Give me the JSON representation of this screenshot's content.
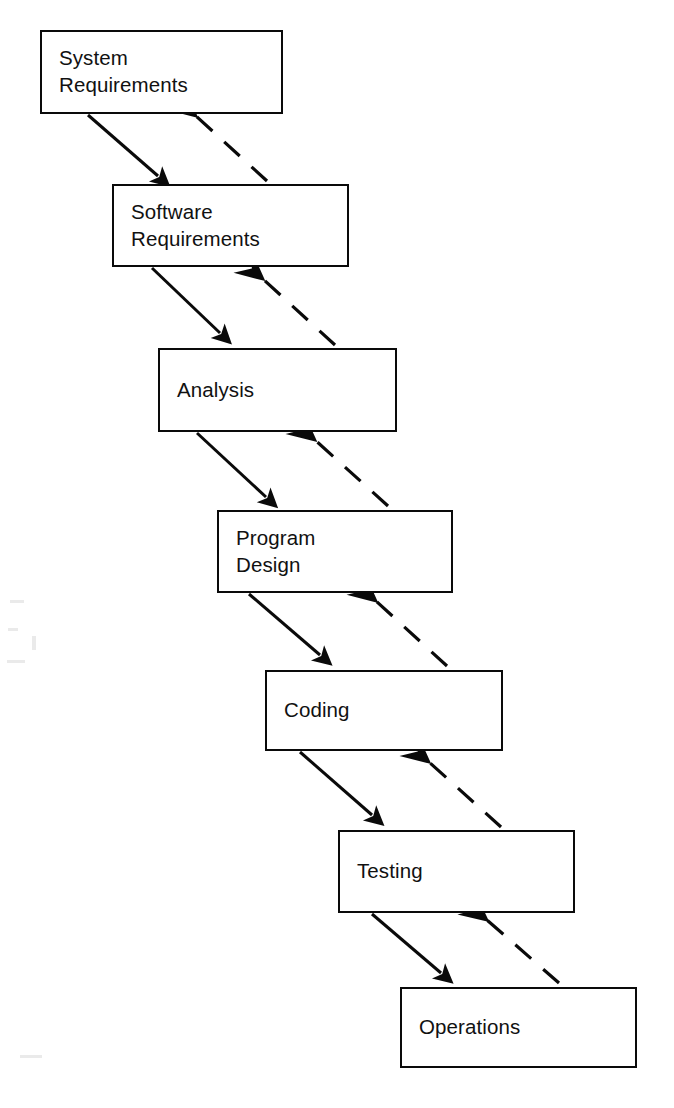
{
  "diagram": {
    "background_color": "#ffffff",
    "line_color": "#0a0a0a",
    "text_color": "#111111",
    "width": 674,
    "height": 1108,
    "stages": [
      {
        "id": "system-requirements",
        "label": "System\nRequirements",
        "x": 40,
        "y": 30,
        "w": 243,
        "h": 84
      },
      {
        "id": "software-requirements",
        "label": "Software\nRequirements",
        "x": 112,
        "y": 184,
        "w": 237,
        "h": 83
      },
      {
        "id": "analysis",
        "label": "Analysis",
        "x": 158,
        "y": 348,
        "w": 239,
        "h": 84
      },
      {
        "id": "program-design",
        "label": "Program\nDesign",
        "x": 217,
        "y": 510,
        "w": 236,
        "h": 83
      },
      {
        "id": "coding",
        "label": "Coding",
        "x": 265,
        "y": 670,
        "w": 238,
        "h": 81
      },
      {
        "id": "testing",
        "label": "Testing",
        "x": 338,
        "y": 830,
        "w": 237,
        "h": 83
      },
      {
        "id": "operations",
        "label": "Operations",
        "x": 400,
        "y": 987,
        "w": 237,
        "h": 81
      }
    ],
    "forward_arrows": [
      {
        "id": "arrow-system-to-software",
        "from": "system-requirements",
        "to": "software-requirements",
        "x1": 88,
        "y1": 115,
        "x2": 158,
        "y2": 176,
        "style": "solid"
      },
      {
        "id": "arrow-software-to-analysis",
        "from": "software-requirements",
        "to": "analysis",
        "x1": 152,
        "y1": 268,
        "x2": 220,
        "y2": 333,
        "style": "solid"
      },
      {
        "id": "arrow-analysis-to-program-design",
        "from": "analysis",
        "to": "program-design",
        "x1": 197,
        "y1": 433,
        "x2": 266,
        "y2": 497,
        "style": "solid"
      },
      {
        "id": "arrow-program-design-to-coding",
        "from": "program-design",
        "to": "coding",
        "x1": 249,
        "y1": 594,
        "x2": 320,
        "y2": 655,
        "style": "solid"
      },
      {
        "id": "arrow-coding-to-testing",
        "from": "coding",
        "to": "testing",
        "x1": 300,
        "y1": 752,
        "x2": 372,
        "y2": 815,
        "style": "solid"
      },
      {
        "id": "arrow-testing-to-operations",
        "from": "testing",
        "to": "operations",
        "x1": 372,
        "y1": 914,
        "x2": 441,
        "y2": 973,
        "style": "solid"
      }
    ],
    "feedback_arrows": [
      {
        "id": "feedback-software-to-system",
        "from": "software-requirements",
        "to": "system-requirements",
        "x1": 267,
        "y1": 181,
        "x2": 196,
        "y2": 116,
        "style": "dashed"
      },
      {
        "id": "feedback-analysis-to-software",
        "from": "analysis",
        "to": "software-requirements",
        "x1": 335,
        "y1": 345,
        "x2": 263,
        "y2": 279,
        "style": "dashed"
      },
      {
        "id": "feedback-program-design-to-analysis",
        "from": "program-design",
        "to": "analysis",
        "x1": 388,
        "y1": 506,
        "x2": 315,
        "y2": 440,
        "style": "dashed"
      },
      {
        "id": "feedback-coding-to-program-design",
        "from": "coding",
        "to": "program-design",
        "x1": 447,
        "y1": 666,
        "x2": 376,
        "y2": 601,
        "style": "dashed"
      },
      {
        "id": "feedback-testing-to-coding",
        "from": "testing",
        "to": "coding",
        "x1": 501,
        "y1": 827,
        "x2": 429,
        "y2": 762,
        "style": "dashed"
      },
      {
        "id": "feedback-operations-to-testing",
        "from": "operations",
        "to": "testing",
        "x1": 559,
        "y1": 983,
        "x2": 487,
        "y2": 920,
        "style": "dashed"
      }
    ]
  }
}
